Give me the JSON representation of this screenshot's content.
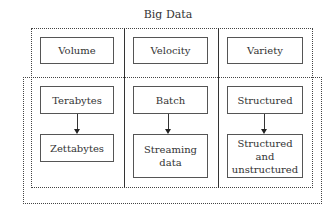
{
  "title": "Big Data",
  "columns": [
    {
      "header": "Volume",
      "from": "Terabytes",
      "to": "Zettabytes"
    },
    {
      "header": "Velocity",
      "from": "Batch",
      "to": "Streaming data"
    },
    {
      "header": "Variety",
      "from": "Structured",
      "to": "Structured and unstructured"
    }
  ]
}
